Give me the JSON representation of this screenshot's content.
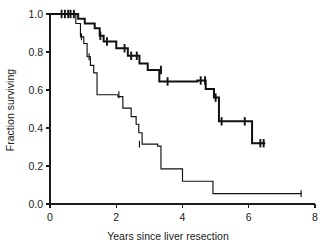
{
  "chart_data": {
    "type": "line",
    "title": "",
    "subtitle": "",
    "xlabel": "Years since liver resection",
    "ylabel": "Fraction surviving",
    "xlim": [
      0,
      8
    ],
    "ylim": [
      0.0,
      1.0
    ],
    "xticks": [
      0,
      2,
      4,
      6,
      8
    ],
    "xtick_labels": [
      "0",
      "2",
      "4",
      "6",
      "8"
    ],
    "yticks": [
      0.0,
      0.2,
      0.4,
      0.6,
      0.8,
      1.0
    ],
    "ytick_labels": [
      "0.0",
      "0.2",
      "0.4",
      "0.6",
      "0.8",
      "1.0"
    ],
    "grid": false,
    "legend": "none",
    "series": [
      {
        "name": "upper-survival-curve",
        "style": "step",
        "linewidth": "thick",
        "x": [
          0.0,
          0.85,
          0.85,
          1.05,
          1.05,
          1.35,
          1.35,
          1.5,
          1.5,
          1.62,
          1.62,
          2.0,
          2.0,
          2.2,
          2.2,
          2.35,
          2.35,
          2.7,
          2.7,
          2.95,
          2.95,
          3.3,
          3.3,
          4.45,
          4.45,
          4.7,
          4.7,
          4.95,
          4.95,
          5.1,
          5.1,
          6.1,
          6.1,
          6.5
        ],
        "y": [
          1.0,
          1.0,
          0.975,
          0.975,
          0.95,
          0.95,
          0.925,
          0.925,
          0.885,
          0.885,
          0.855,
          0.855,
          0.82,
          0.82,
          0.82,
          0.82,
          0.78,
          0.78,
          0.74,
          0.74,
          0.705,
          0.705,
          0.645,
          0.645,
          0.65,
          0.65,
          0.605,
          0.605,
          0.56,
          0.56,
          0.435,
          0.435,
          0.32,
          0.32
        ],
        "censor_points": [
          {
            "x": 0.35,
            "y": 1.0
          },
          {
            "x": 0.45,
            "y": 1.0
          },
          {
            "x": 0.55,
            "y": 1.0
          },
          {
            "x": 0.62,
            "y": 1.0
          },
          {
            "x": 0.72,
            "y": 1.0
          },
          {
            "x": 1.52,
            "y": 0.885
          },
          {
            "x": 1.72,
            "y": 0.855
          },
          {
            "x": 2.25,
            "y": 0.82
          },
          {
            "x": 2.45,
            "y": 0.78
          },
          {
            "x": 2.62,
            "y": 0.78
          },
          {
            "x": 3.35,
            "y": 0.705
          },
          {
            "x": 3.55,
            "y": 0.645
          },
          {
            "x": 4.55,
            "y": 0.65
          },
          {
            "x": 4.68,
            "y": 0.65
          },
          {
            "x": 5.0,
            "y": 0.56
          },
          {
            "x": 5.18,
            "y": 0.435
          },
          {
            "x": 5.88,
            "y": 0.435
          },
          {
            "x": 6.35,
            "y": 0.32
          },
          {
            "x": 6.45,
            "y": 0.32
          }
        ]
      },
      {
        "name": "lower-survival-curve",
        "style": "step",
        "linewidth": "thin",
        "x": [
          0.0,
          0.78,
          0.78,
          0.92,
          0.92,
          1.02,
          1.02,
          1.12,
          1.12,
          1.22,
          1.22,
          1.32,
          1.32,
          1.42,
          1.42,
          2.05,
          2.05,
          2.2,
          2.2,
          2.45,
          2.45,
          2.6,
          2.6,
          2.68,
          2.68,
          2.78,
          2.78,
          3.25,
          3.25,
          3.35,
          3.35,
          4.0,
          4.0,
          4.92,
          4.92,
          7.6
        ],
        "y": [
          1.0,
          1.0,
          0.95,
          0.95,
          0.88,
          0.88,
          0.845,
          0.845,
          0.775,
          0.775,
          0.73,
          0.73,
          0.69,
          0.69,
          0.575,
          0.575,
          0.565,
          0.565,
          0.505,
          0.505,
          0.46,
          0.46,
          0.42,
          0.42,
          0.375,
          0.375,
          0.315,
          0.315,
          0.305,
          0.305,
          0.185,
          0.185,
          0.12,
          0.12,
          0.055,
          0.055
        ],
        "censor_points": [
          {
            "x": 0.55,
            "y": 1.0
          },
          {
            "x": 0.95,
            "y": 0.88
          },
          {
            "x": 1.18,
            "y": 0.775
          },
          {
            "x": 2.08,
            "y": 0.575
          },
          {
            "x": 2.7,
            "y": 0.315
          },
          {
            "x": 7.58,
            "y": 0.055
          }
        ]
      }
    ]
  },
  "axes": {
    "x_axis_name": "years-axis",
    "y_axis_name": "fraction-axis"
  }
}
